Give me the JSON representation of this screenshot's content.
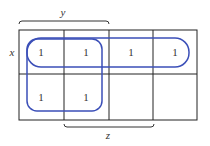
{
  "kmap": {
    "row_variable": "x",
    "top_variable": "y",
    "bottom_variable": "z",
    "cells": [
      [
        "1",
        "1",
        "1",
        "1"
      ],
      [
        "1",
        "1",
        "",
        ""
      ]
    ],
    "groups": [
      {
        "name": "x",
        "cells": "row 0, columns 0-3"
      },
      {
        "name": "y",
        "cells": "rows 0-1, columns 0-1"
      }
    ],
    "group_color": "#3b4fb8"
  }
}
